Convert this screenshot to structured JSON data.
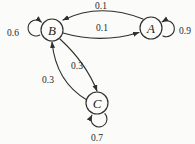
{
  "diagram": {
    "type": "markov-chain-state-transition-diagram",
    "colors": {
      "background": "#fbfbf9",
      "stroke": "#2e2e2e",
      "text": "#1f1f1f"
    },
    "nodes": [
      {
        "id": "B",
        "label": "B"
      },
      {
        "id": "A",
        "label": "A"
      },
      {
        "id": "C",
        "label": "C"
      }
    ],
    "edges": [
      {
        "from": "A",
        "to": "B",
        "label": "0.1"
      },
      {
        "from": "B",
        "to": "A",
        "label": "0.1"
      },
      {
        "from": "B",
        "to": "B",
        "label": "0.6"
      },
      {
        "from": "A",
        "to": "A",
        "label": "0.9"
      },
      {
        "from": "B",
        "to": "C",
        "label": "0.3"
      },
      {
        "from": "C",
        "to": "B",
        "label": "0.3"
      },
      {
        "from": "C",
        "to": "C",
        "label": "0.7"
      }
    ]
  }
}
